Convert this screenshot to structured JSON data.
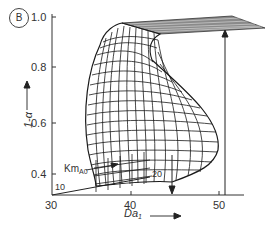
{
  "figure": {
    "panel_label": "B",
    "y_axis": {
      "label": "1-α",
      "ticks": [
        {
          "label": "1.0",
          "y": 17
        },
        {
          "label": "0.8",
          "y": 67
        },
        {
          "label": "0.6",
          "y": 123
        },
        {
          "label": "0.4",
          "y": 174
        }
      ]
    },
    "x_axis": {
      "label_main": "Da",
      "label_sub": "1",
      "ticks": [
        {
          "label": "30",
          "x": 52
        },
        {
          "label": "40",
          "x": 131
        },
        {
          "label": "50",
          "x": 219
        }
      ]
    },
    "annotations": {
      "km_main": "Km",
      "km_sub": "A0",
      "km_start": "10",
      "km_end": "20"
    },
    "colors": {
      "ink": "#222222",
      "mesh": "#1a1a1a",
      "plane": "#555555"
    }
  }
}
